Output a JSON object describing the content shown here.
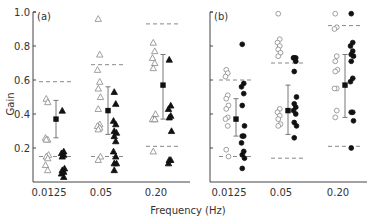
{
  "chart_data": [
    {
      "type": "scatter",
      "panel_label": "(a)",
      "ylabel": "Gain",
      "xlabel": "Frequency (Hz)",
      "categories": [
        "0.0125",
        "0.05",
        "0.20"
      ],
      "yticks": [
        "0.2",
        "0.4",
        "0.6",
        "0.8",
        "1.0"
      ],
      "ylim": [
        0,
        1.0
      ],
      "marker_open": "triangle-open",
      "marker_filled": "triangle-filled",
      "groups": [
        {
          "category": "0.0125",
          "open": [
            0.49,
            0.47,
            0.26,
            0.25,
            0.25,
            0.16,
            0.15,
            0.14,
            0.1,
            0.07
          ],
          "filled": [
            0.42,
            0.18,
            0.17,
            0.16,
            0.15,
            0.08,
            0.07,
            0.06,
            0.05,
            0.03
          ],
          "mean": 0.37,
          "sd_low": 0.26,
          "sd_high": 0.48,
          "dashed_upper": 0.59,
          "dashed_lower": 0.15
        },
        {
          "category": "0.05",
          "open": [
            0.96,
            0.75,
            0.66,
            0.59,
            0.55,
            0.5,
            0.43,
            0.34,
            0.33,
            0.32,
            0.31,
            0.15,
            0.13
          ],
          "filled": [
            0.53,
            0.46,
            0.36,
            0.34,
            0.3,
            0.29,
            0.27,
            0.24,
            0.18,
            0.15,
            0.11,
            0.11,
            0.07
          ],
          "mean": 0.42,
          "sd_low": 0.28,
          "sd_high": 0.56,
          "dashed_upper": 0.69,
          "dashed_lower": 0.15
        },
        {
          "category": "0.20",
          "open": [
            0.82,
            0.77,
            0.73,
            0.7,
            0.67,
            0.4,
            0.37,
            0.37,
            0.37,
            0.37,
            0.18
          ],
          "filled": [
            0.72,
            0.45,
            0.43,
            0.39,
            0.38,
            0.3,
            0.13,
            0.13,
            0.11
          ],
          "mean": 0.57,
          "sd_low": 0.37,
          "sd_high": 0.75,
          "dashed_upper": 0.93,
          "dashed_lower": 0.21
        }
      ]
    },
    {
      "type": "scatter",
      "panel_label": "(b)",
      "ylabel": "",
      "xlabel": "Frequency (Hz)",
      "categories": [
        "0.0125",
        "0.05",
        "0.20"
      ],
      "ylim": [
        0,
        1.0
      ],
      "marker_open": "circle-open",
      "marker_filled": "circle-filled",
      "groups": [
        {
          "category": "0.0125",
          "open": [
            0.66,
            0.64,
            0.62,
            0.51,
            0.49,
            0.45,
            0.43,
            0.38,
            0.37,
            0.33,
            0.19,
            0.15
          ],
          "filled": [
            0.81,
            0.58,
            0.56,
            0.52,
            0.45,
            0.33,
            0.27,
            0.27,
            0.23,
            0.18,
            0.16,
            0.14,
            0.08
          ],
          "mean": 0.37,
          "sd_low": 0.27,
          "sd_high": 0.49,
          "dashed_upper": 0.6,
          "dashed_lower": 0.15
        },
        {
          "category": "0.05",
          "open": [
            0.99,
            0.84,
            0.82,
            0.8,
            0.78,
            0.76,
            0.74,
            0.43,
            0.41,
            0.39,
            0.37,
            0.34,
            0.33
          ],
          "filled": [
            0.73,
            0.73,
            0.73,
            0.71,
            0.65,
            0.5,
            0.46,
            0.44,
            0.42,
            0.4,
            0.35,
            0.33,
            0.26
          ],
          "mean": 0.42,
          "sd_low": 0.28,
          "sd_high": 0.57,
          "dashed_upper": 0.7,
          "dashed_lower": 0.14
        },
        {
          "category": "0.20",
          "open": [
            0.99,
            0.91,
            0.9,
            0.74,
            0.71,
            0.66,
            0.65,
            0.55,
            0.55,
            0.42,
            0.38
          ],
          "filled": [
            0.99,
            0.82,
            0.8,
            0.77,
            0.75,
            0.74,
            0.71,
            0.61,
            0.59,
            0.41,
            0.41,
            0.36,
            0.2
          ],
          "mean": 0.57,
          "sd_low": 0.38,
          "sd_high": 0.75,
          "dashed_upper": 0.92,
          "dashed_lower": 0.21
        }
      ]
    }
  ],
  "labels": {
    "panel_a": "(a)",
    "panel_b": "(b)",
    "ylabel": "Gain",
    "xlabel": "Frequency (Hz)",
    "yticks": [
      "0.2",
      "0.4",
      "0.6",
      "0.8",
      "1.0"
    ],
    "xticks": [
      "0.0125",
      "0.05",
      "0.20"
    ]
  },
  "colors": {
    "ink": "#111111",
    "axis": "#444444",
    "dashed": "#888888",
    "errorbar": "#777777",
    "open_marker": "#888888"
  }
}
